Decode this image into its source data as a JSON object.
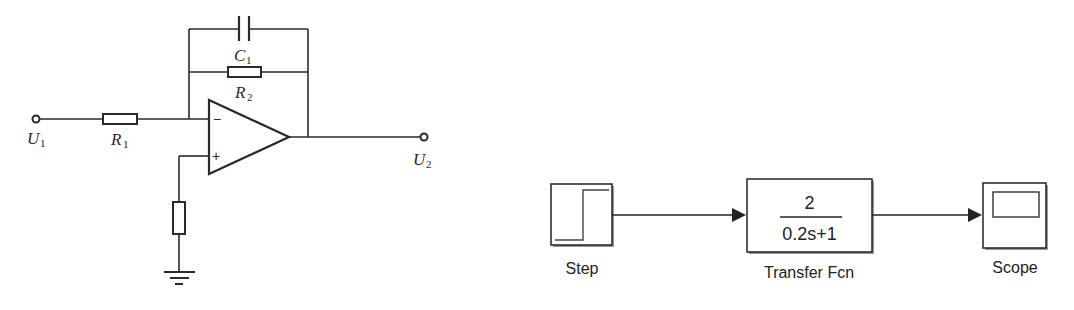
{
  "circuit": {
    "input_terminal": {
      "label": "U",
      "subscript": "1"
    },
    "output_terminal": {
      "label": "U",
      "subscript": "2"
    },
    "input_resistor": {
      "label": "R",
      "subscript": "1"
    },
    "feedback_resistor": {
      "label": "R",
      "subscript": "2"
    },
    "feedback_capacitor": {
      "label": "C",
      "subscript": "1"
    },
    "opamp": {
      "inverting_symbol": "−",
      "noninverting_symbol": "+"
    },
    "ground_resistor": {
      "label": ""
    },
    "colors": {
      "stroke": "#2a2a2a"
    }
  },
  "simulink": {
    "blocks": [
      {
        "id": "step",
        "label": "Step"
      },
      {
        "id": "transfer_fcn",
        "label": "Transfer Fcn",
        "numerator": "2",
        "denominator": "0.2s+1"
      },
      {
        "id": "scope",
        "label": "Scope"
      }
    ],
    "colors": {
      "stroke": "#222222",
      "shadow": "#9a9a9a"
    }
  }
}
